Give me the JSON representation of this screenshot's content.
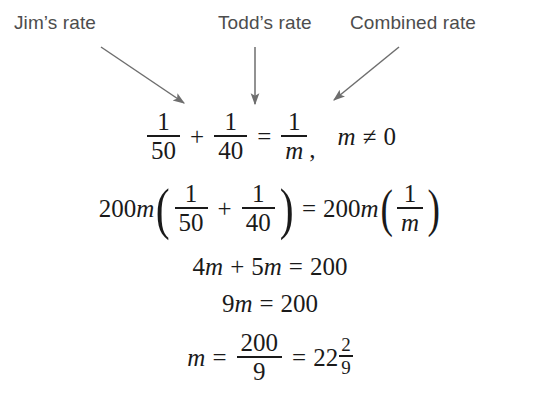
{
  "figure": {
    "type": "algebra-worked-solution",
    "background_color": "#ffffff",
    "label_color": "#4d4d4d",
    "math_color": "#1a1a1a",
    "arrow_color": "#6e6e6e"
  },
  "callouts": [
    {
      "id": "jim",
      "label": "Jim’s rate",
      "arrow": "diagonal-down-right",
      "points_to": "1/50"
    },
    {
      "id": "todd",
      "label": "Todd’s rate",
      "arrow": "vertical-down",
      "points_to": "1/40"
    },
    {
      "id": "combined",
      "label": "Combined rate",
      "arrow": "diagonal-down-left",
      "points_to": "1/m"
    }
  ],
  "equations": {
    "line1": {
      "text": "1/50 + 1/40 = 1/m,  m ≠ 0",
      "frac1": {
        "num": "1",
        "den": "50"
      },
      "plus": "+",
      "frac2": {
        "num": "1",
        "den": "40"
      },
      "equals": "=",
      "frac3": {
        "num": "1",
        "den": "m"
      },
      "comma": ",",
      "variable": "m",
      "relation": "≠",
      "value": "0"
    },
    "line2": {
      "text": "200m(1/50 + 1/40) = 200m(1/m)",
      "coef_left_num": "200",
      "coef_left_var": "m",
      "paren_open": "(",
      "frac1": {
        "num": "1",
        "den": "50"
      },
      "plus": "+",
      "frac2": {
        "num": "1",
        "den": "40"
      },
      "paren_close": ")",
      "equals": "=",
      "coef_right_num": "200",
      "coef_right_var": "m",
      "paren_open2": "(",
      "frac3": {
        "num": "1",
        "den": "m"
      },
      "paren_close2": ")"
    },
    "line3": {
      "text": "4m + 5m = 200",
      "term1_coef": "4",
      "term1_var": "m",
      "plus": "+",
      "term2_coef": "5",
      "term2_var": "m",
      "equals": "=",
      "result": "200"
    },
    "line4": {
      "text": "9m = 200",
      "coef": "9",
      "variable": "m",
      "equals": "=",
      "result": "200"
    },
    "line5": {
      "text": "m = 200/9 = 22 2/9",
      "variable": "m",
      "equals1": "=",
      "frac": {
        "num": "200",
        "den": "9"
      },
      "equals2": "=",
      "mixed_int": "22",
      "mixed_frac": {
        "num": "2",
        "den": "9"
      }
    }
  }
}
